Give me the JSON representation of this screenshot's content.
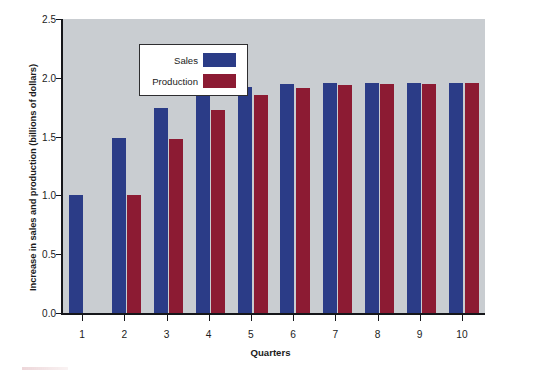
{
  "chart_data": {
    "type": "bar",
    "title": "",
    "xlabel": "Quarters",
    "ylabel": "Increase in sales and production (billions of dollars)",
    "categories": [
      "1",
      "2",
      "3",
      "4",
      "5",
      "6",
      "7",
      "8",
      "9",
      "10"
    ],
    "series": [
      {
        "name": "Sales",
        "color": "#2b3c87",
        "values": [
          1.0,
          1.49,
          1.74,
          1.86,
          1.92,
          1.95,
          1.96,
          1.96,
          1.96,
          1.96
        ]
      },
      {
        "name": "Production",
        "color": "#8c1b33",
        "values": [
          0.0,
          1.0,
          1.48,
          1.73,
          1.85,
          1.91,
          1.94,
          1.95,
          1.95,
          1.96
        ]
      }
    ],
    "ylim": [
      0.0,
      2.5
    ],
    "yticks": [
      "0.0",
      "0.5",
      "1.0",
      "1.5",
      "2.0",
      "2.5"
    ],
    "ytick_values": [
      0.0,
      0.5,
      1.0,
      1.5,
      2.0,
      2.5
    ],
    "grid": false,
    "legend_position": "top-left",
    "plot_background": "#c9cdd1",
    "axis_color": "#15161a"
  }
}
